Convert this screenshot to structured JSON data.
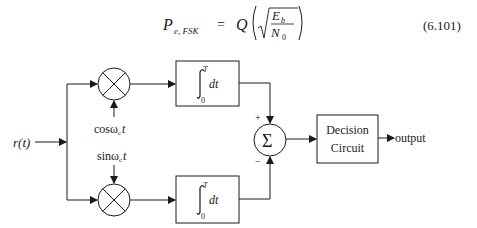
{
  "equation": {
    "lhs_symbol": "P",
    "lhs_subscript": "e, FSK",
    "equals": "=",
    "function": "Q",
    "numerator": "E",
    "numerator_subscript": "b",
    "denominator": "N",
    "denominator_subscript": "0",
    "number": "(6.101)"
  },
  "diagram": {
    "input_label": "r(t)",
    "upper_carrier": {
      "prefix": "cos",
      "omega": "ω",
      "sub": "c",
      "var": "t"
    },
    "lower_carrier": {
      "prefix": "sin",
      "omega": "ω",
      "sub": "c",
      "var": "t"
    },
    "integrator": {
      "upper_limit": "T",
      "lower_limit": "0",
      "body": "dt"
    },
    "summer_symbol": "Σ",
    "plus_sign": "+",
    "minus_sign": "−",
    "decision_line1": "Decision",
    "decision_line2": "Circuit",
    "output_label": "output"
  }
}
